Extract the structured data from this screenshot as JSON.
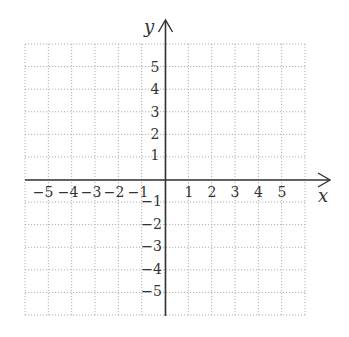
{
  "diagram": {
    "type": "coordinate-grid",
    "x_axis": {
      "label": "x",
      "positive_ticks": [
        "1",
        "2",
        "3",
        "4",
        "5"
      ],
      "negative_ticks": [
        "−5",
        "−4",
        "−3",
        "−2",
        "−1"
      ]
    },
    "y_axis": {
      "label": "y",
      "positive_ticks": [
        "5",
        "4",
        "3",
        "2",
        "1"
      ],
      "negative_ticks": [
        "−1",
        "−2",
        "−3",
        "−4",
        "−5"
      ]
    },
    "grid": {
      "range": [
        -6,
        6
      ],
      "style": "dotted",
      "color": "#aaaaaa"
    },
    "axis_color": "#333333"
  }
}
